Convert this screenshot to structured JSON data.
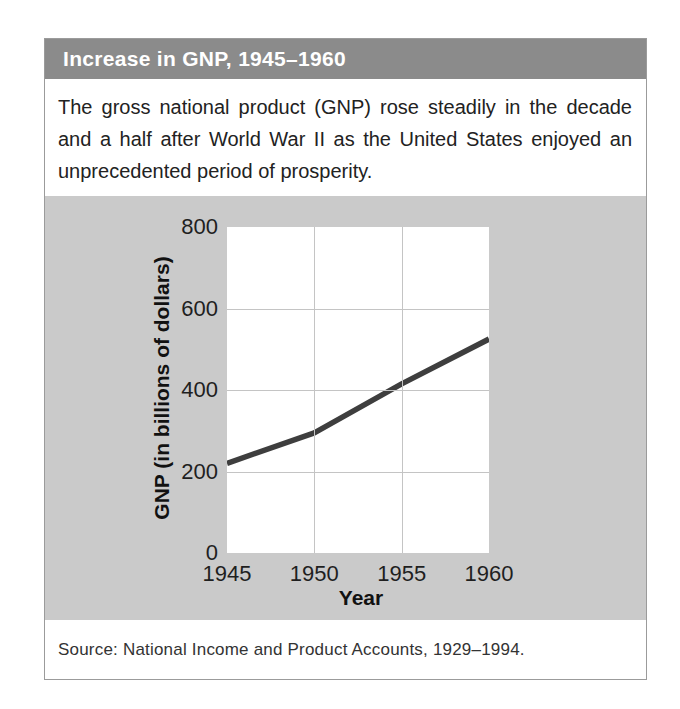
{
  "figure": {
    "title": "Increase in GNP, 1945–1960",
    "description": "The gross national product (GNP) rose steadily in the decade and a half after World War II as the United States enjoyed an unprecedented period of prosperity.",
    "source": "Source: National Income and Product Accounts, 1929–1994."
  },
  "chart_data": {
    "type": "line",
    "title": "Increase in GNP, 1945–1960",
    "x": [
      1945,
      1950,
      1955,
      1960
    ],
    "series": [
      {
        "name": "GNP",
        "values": [
          220,
          295,
          415,
          525
        ]
      }
    ],
    "xlabel": "Year",
    "ylabel": "GNP (in billions of dollars)",
    "xlim": [
      1945,
      1960
    ],
    "ylim": [
      0,
      800
    ],
    "xticks": [
      1945,
      1950,
      1955,
      1960
    ],
    "yticks": [
      0,
      200,
      400,
      600,
      800
    ],
    "grid": true,
    "legend": false
  },
  "colors": {
    "header_bg": "#8b8b8b",
    "panel_bg": "#cacaca",
    "grid": "#c4c4c4",
    "box_border": "#9b9b9b",
    "line": "#3e3e3e",
    "title_text": "#ffffff",
    "body_text": "#222222"
  }
}
